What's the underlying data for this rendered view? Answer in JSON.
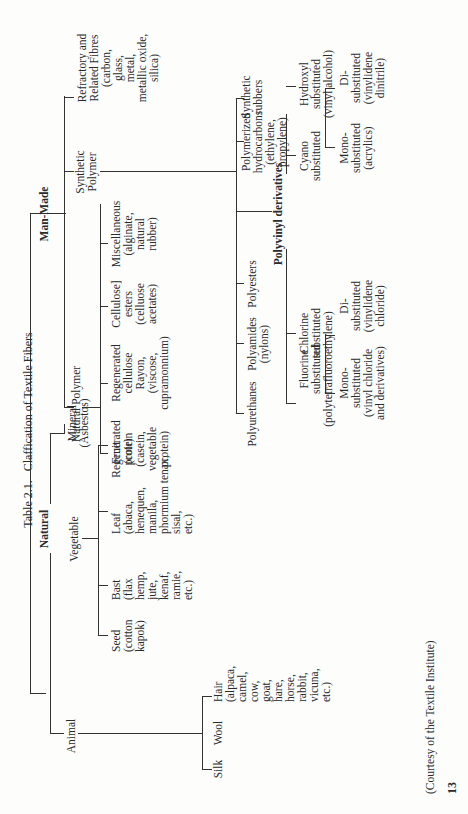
{
  "title": "Table 2.1.   Claffication of Textile Fibers",
  "page_number": "13",
  "credit": "(Courtesy of the Textile Institute)",
  "tree": {
    "natural": {
      "label": "Natural",
      "animal": {
        "label": "Animal",
        "silk": "Silk",
        "wool": "Wool",
        "hair": "Hair\n(alpaca,\ncamel,\ncow,\ngoat,\nhare,\nhorse,\nrabbit,\nvicuna,\netc.)"
      },
      "vegetable": {
        "label": "Vegetable",
        "seed": "Seed\n(cotton\nkapok)",
        "bast": "Bast\n(flax\nhemp,\njute,\nkenaf,\nramie,\netc.)",
        "leaf": "Leaf\n(abaca,\nhenequen,\nmanila,\nphormium tenax,\nsisal,\netc.)",
        "fruit": "Fruit\n(coir)"
      },
      "mineral": "Mineral\n(Asbestos)"
    },
    "man_made": {
      "label": "Man-Made",
      "natural_polymer": {
        "label": "Natural Polymer",
        "regen_protein": "Regenerated\nprotein\n(casein,\nvegetable\nprotein)",
        "regen_cellulose": "Regenerated\ncellulose\nRayon,\n(viscose,\ncupramonnium)",
        "cellulose_esters": "Cellulose]\nesters\n(celluose\nacetates)",
        "misc": "Miscellaneous\n(alginate,\nnatural\nrubber)"
      },
      "synthetic_polymer": {
        "label": "Synthetic\nPolymer",
        "polyurethanes": "Polyurethanes",
        "polyamides": "Polyamides\n(nylons)",
        "polyesters": "Polyesters",
        "polyvinyl": {
          "label": "Polyvinyl derivatives",
          "fluorine": "Fluorine\nsubstituted\n(polytetrafluoroethylene)",
          "chlorine": "Chlorine\nsubstituted",
          "chlorine_mono": "Mono-\nsubstituted\n(vinyl chloride\nand derivatives)",
          "chlorine_di": "Di-\nsubstituted\n(vinylidene\nchloride)",
          "cyano": "Cyano\nsubstituted",
          "cyano_mono": "Mono-\nsubstituted\n(acrylics)",
          "cyano_di": "Di-\nsubstituted\n(vinylidene\ndinitrile)",
          "hydroxyl": "Hydroxyl\nsubstituted\n(vinyl alcohol)"
        },
        "polymerized_hydrocarbons": "Polymerized\nhydrocarbons\n(ethylene,\npropylene)",
        "synthetic_rubbers": "Synthetic\nrubbers"
      },
      "refractory": "Refractory and\nRelated Fibres\n(carbon,\nglass,\nmetal,\nmetallic oxide,\nsilica)"
    }
  }
}
